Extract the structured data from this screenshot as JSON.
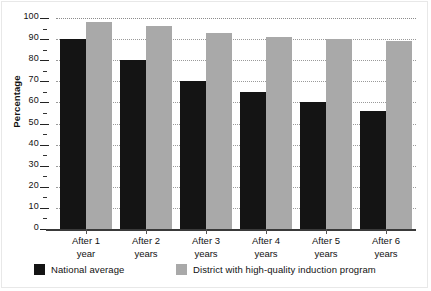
{
  "chart_data": {
    "type": "bar",
    "title": "",
    "xlabel": "",
    "ylabel": "Percentage",
    "ylim": [
      0,
      100
    ],
    "ytick_step": 10,
    "yticks": [
      0,
      10,
      20,
      30,
      40,
      50,
      60,
      70,
      80,
      90,
      100
    ],
    "minor_tick_step": 5,
    "grid": true,
    "legend_position": "bottom-left",
    "categories": [
      "After 1 year",
      "After 2 years",
      "After 3 years",
      "After 4 years",
      "After 5 years",
      "After 6 years"
    ],
    "category_lines": [
      {
        "line1": "After 1",
        "line2": "year"
      },
      {
        "line1": "After 2",
        "line2": "years"
      },
      {
        "line1": "After 3",
        "line2": "years"
      },
      {
        "line1": "After 4",
        "line2": "years"
      },
      {
        "line1": "After 5",
        "line2": "years"
      },
      {
        "line1": "After 6",
        "line2": "years"
      }
    ],
    "series": [
      {
        "name": "National average",
        "color": "#141414",
        "values": [
          90,
          80,
          70,
          65,
          60,
          56
        ]
      },
      {
        "name": "District with high-quality induction program",
        "color": "#a9a9a9",
        "values": [
          98,
          96,
          93,
          91,
          90,
          89
        ]
      }
    ]
  },
  "axis": {
    "y_title": "Percentage",
    "tick_labels": [
      "100",
      "90",
      "80",
      "70",
      "60",
      "50",
      "40",
      "30",
      "20",
      "10",
      "0"
    ]
  },
  "legend": {
    "items": [
      {
        "label": "National average",
        "color": "#141414"
      },
      {
        "label": "District with high-quality induction program",
        "color": "#a9a9a9"
      }
    ]
  }
}
